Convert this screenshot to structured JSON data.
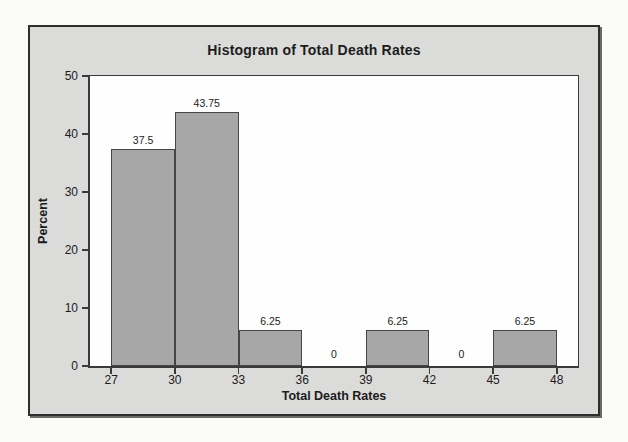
{
  "page": {
    "background": "#fbfbf8"
  },
  "frame": {
    "panel_color": "#dbdbda",
    "border_color": "#2e2e2e"
  },
  "chart_data": {
    "type": "bar",
    "subtype": "histogram",
    "title": "Histogram of Total Death Rates",
    "xlabel": "Total Death Rates",
    "ylabel": "Percent",
    "xlim": [
      26,
      49
    ],
    "ylim": [
      0,
      50
    ],
    "x_ticks": [
      "27",
      "30",
      "33",
      "36",
      "39",
      "42",
      "45",
      "48"
    ],
    "x_tick_values": [
      27,
      30,
      33,
      36,
      39,
      42,
      45,
      48
    ],
    "y_ticks": [
      "0",
      "10",
      "20",
      "30",
      "40",
      "50"
    ],
    "y_tick_values": [
      0,
      10,
      20,
      30,
      40,
      50
    ],
    "bin_width": 3,
    "categories": [
      "27-30",
      "30-33",
      "33-36",
      "36-39",
      "39-42",
      "42-45",
      "45-48"
    ],
    "values": [
      37.5,
      43.75,
      6.25,
      0,
      6.25,
      0,
      6.25
    ],
    "bins": [
      {
        "start": 27,
        "end": 30,
        "value": 37.5,
        "label": "37.5"
      },
      {
        "start": 30,
        "end": 33,
        "value": 43.75,
        "label": "43.75"
      },
      {
        "start": 33,
        "end": 36,
        "value": 6.25,
        "label": "6.25"
      },
      {
        "start": 36,
        "end": 39,
        "value": 0,
        "label": "0"
      },
      {
        "start": 39,
        "end": 42,
        "value": 6.25,
        "label": "6.25"
      },
      {
        "start": 42,
        "end": 45,
        "value": 0,
        "label": "0"
      },
      {
        "start": 45,
        "end": 48,
        "value": 6.25,
        "label": "6.25"
      }
    ],
    "grid": false,
    "legend": null,
    "colors": {
      "bar_fill": "#a7a7a7",
      "bar_border": "#454545",
      "plot_background": "#fefefe",
      "panel_background": "#dbdbda",
      "axis_color": "#3a3a3a",
      "text_color": "#1c1c1c"
    }
  }
}
